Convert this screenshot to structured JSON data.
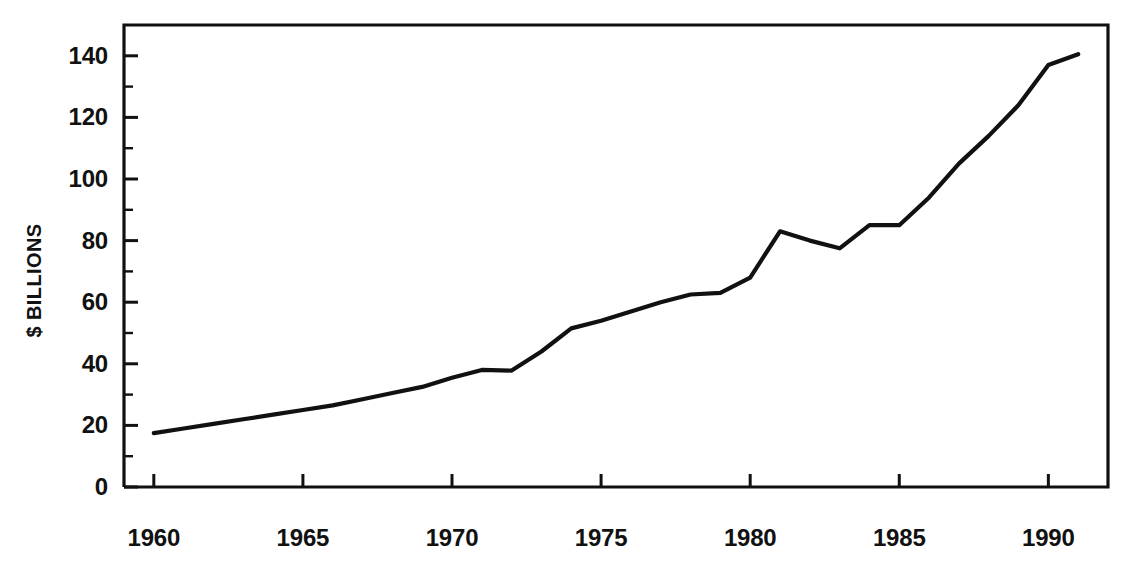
{
  "chart_data": {
    "type": "line",
    "title": "",
    "xlabel": "",
    "ylabel": "$ BILLIONS",
    "xlim": [
      1959,
      1992
    ],
    "ylim": [
      0,
      150
    ],
    "grid": false,
    "legend": "none",
    "x_ticks": [
      "1960",
      "1965",
      "1970",
      "1975",
      "1980",
      "1985",
      "1990"
    ],
    "x_tick_values": [
      1960,
      1965,
      1970,
      1975,
      1980,
      1985,
      1990
    ],
    "y_ticks": [
      "0",
      "20",
      "40",
      "60",
      "80",
      "100",
      "120",
      "140"
    ],
    "y_tick_values": [
      0,
      20,
      40,
      60,
      80,
      100,
      120,
      140
    ],
    "y_minor_interval": 10,
    "line_color": "#111111",
    "x": [
      1960,
      1961,
      1962,
      1963,
      1964,
      1965,
      1966,
      1967,
      1968,
      1969,
      1970,
      1971,
      1972,
      1973,
      1974,
      1975,
      1976,
      1977,
      1978,
      1979,
      1980,
      1981,
      1982,
      1983,
      1984,
      1985,
      1986,
      1987,
      1988,
      1989,
      1990,
      1991
    ],
    "values": [
      17.5,
      19.0,
      20.5,
      22.0,
      23.5,
      25.0,
      26.5,
      28.5,
      30.5,
      32.5,
      35.5,
      38.0,
      37.8,
      44.0,
      51.5,
      54.0,
      57.0,
      60.0,
      62.5,
      63.0,
      68.0,
      83.0,
      80.0,
      77.5,
      85.0,
      85.0,
      94.0,
      105.0,
      114.0,
      124.0,
      137.0,
      140.5
    ],
    "series": [
      {
        "name": "$ BILLIONS",
        "values": [
          17.5,
          19.0,
          20.5,
          22.0,
          23.5,
          25.0,
          26.5,
          28.5,
          30.5,
          32.5,
          35.5,
          38.0,
          37.8,
          44.0,
          51.5,
          54.0,
          57.0,
          60.0,
          62.5,
          63.0,
          68.0,
          83.0,
          80.0,
          77.5,
          85.0,
          85.0,
          94.0,
          105.0,
          114.0,
          124.0,
          137.0,
          140.5
        ]
      }
    ]
  }
}
